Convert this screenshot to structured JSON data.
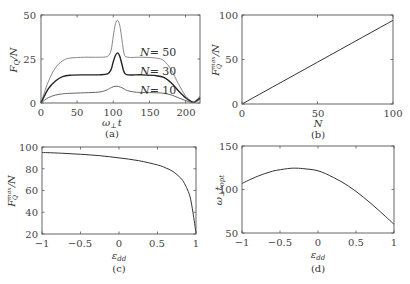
{
  "chart_data": [
    {
      "panel": "(a)",
      "type": "line",
      "title": "",
      "xlabel": "ω⊥t",
      "ylabel": "F_Q/N",
      "xlim": [
        0,
        220
      ],
      "ylim": [
        0,
        50
      ],
      "xticks": [
        0,
        50,
        100,
        150,
        200
      ],
      "yticks": [
        0,
        25,
        50
      ],
      "grid": false,
      "series": [
        {
          "name": "N= 50",
          "color": "#888888",
          "x": [
            0,
            10,
            20,
            30,
            40,
            60,
            80,
            92,
            97,
            100,
            103,
            106,
            109,
            112,
            115,
            120,
            140,
            160,
            170,
            180,
            190,
            200,
            208,
            212,
            216,
            220
          ],
          "y": [
            0,
            12,
            20,
            24,
            25.5,
            26,
            26,
            26.5,
            30,
            38,
            45,
            47,
            44,
            36,
            28,
            26,
            26,
            25.5,
            24,
            19,
            11,
            4,
            1,
            0.5,
            2,
            4
          ]
        },
        {
          "name": "N= 30",
          "color": "#222222",
          "x": [
            0,
            10,
            20,
            30,
            40,
            60,
            80,
            92,
            97,
            100,
            103,
            106,
            109,
            112,
            115,
            120,
            140,
            160,
            170,
            180,
            190,
            200,
            208,
            212,
            216,
            220
          ],
          "y": [
            0,
            8,
            12.5,
            15,
            15.8,
            16,
            16,
            16.5,
            19,
            23.5,
            27,
            28.5,
            26.5,
            22,
            17.5,
            16,
            16,
            15.5,
            14.5,
            11.5,
            7,
            3,
            0.8,
            0.5,
            1.5,
            3
          ]
        },
        {
          "name": "N= 10",
          "color": "#666666",
          "x": [
            0,
            10,
            20,
            30,
            40,
            60,
            80,
            90,
            95,
            100,
            105,
            110,
            115,
            120,
            130,
            140,
            160,
            170,
            180,
            190,
            200,
            208,
            212,
            216,
            220
          ],
          "y": [
            0,
            3,
            4.5,
            5.2,
            5.5,
            5.8,
            6.2,
            7.2,
            8.3,
            9.2,
            9.5,
            9.0,
            8.0,
            7.0,
            6.2,
            6.0,
            5.8,
            5.5,
            4.6,
            3,
            1.4,
            0.4,
            0.3,
            1,
            2
          ]
        }
      ],
      "annotations": [
        "N= 50",
        "N= 30",
        "N= 10"
      ]
    },
    {
      "panel": "(b)",
      "type": "line",
      "title": "",
      "xlabel": "N",
      "ylabel": "F_Q^max/N",
      "xlim": [
        0,
        100
      ],
      "ylim": [
        0,
        100
      ],
      "xticks": [
        0,
        50,
        100
      ],
      "yticks": [
        0,
        50,
        100
      ],
      "grid": false,
      "series": [
        {
          "name": "F_Q^max/N",
          "color": "#333333",
          "x": [
            0,
            100
          ],
          "y": [
            0,
            94
          ]
        }
      ]
    },
    {
      "panel": "(c)",
      "type": "line",
      "title": "",
      "xlabel": "ε_dd",
      "ylabel": "F_Q^max/N",
      "xlim": [
        -1,
        1
      ],
      "ylim": [
        20,
        100
      ],
      "xticks": [
        -1,
        -0.5,
        0,
        0.5,
        1
      ],
      "yticks": [
        20,
        40,
        60,
        80,
        100
      ],
      "grid": false,
      "series": [
        {
          "name": "F_Q^max/N",
          "color": "#333333",
          "x": [
            -1,
            -0.75,
            -0.5,
            -0.25,
            0,
            0.25,
            0.5,
            0.6,
            0.7,
            0.8,
            0.85,
            0.9,
            0.93,
            0.96,
            1.0
          ],
          "y": [
            95,
            94.3,
            93.3,
            92,
            90,
            87.5,
            83.5,
            81,
            77.5,
            71.5,
            66.5,
            59,
            52,
            40,
            21
          ]
        }
      ]
    },
    {
      "panel": "(d)",
      "type": "line",
      "title": "",
      "xlabel": "ε_dd",
      "ylabel": "ω⊥t_opt",
      "xlim": [
        -1,
        1
      ],
      "ylim": [
        50,
        150
      ],
      "xticks": [
        -1,
        -0.5,
        0,
        0.5,
        1
      ],
      "yticks": [
        50,
        100,
        150
      ],
      "grid": false,
      "series": [
        {
          "name": "ω⊥t_opt",
          "color": "#333333",
          "x": [
            -1,
            -0.8,
            -0.6,
            -0.4,
            -0.3,
            -0.2,
            0,
            0.2,
            0.4,
            0.6,
            0.8,
            1.0
          ],
          "y": [
            107,
            115,
            121,
            124,
            124.5,
            124,
            121.5,
            114,
            104,
            91,
            76,
            60
          ]
        }
      ]
    }
  ],
  "panels": {
    "a": {
      "label": "(a)",
      "xlabel_main": "ω",
      "xlabel_sub": "⊥",
      "xlabel_tail": "t",
      "ylabel": "F_Q/N",
      "xticks": [
        "0",
        "50",
        "100",
        "150",
        "200"
      ],
      "yticks": [
        "0",
        "25",
        "50"
      ],
      "legend": [
        "N= 50",
        "N= 30",
        "N= 10"
      ]
    },
    "b": {
      "label": "(b)",
      "xlabel": "N",
      "ylabel": "F_Q^max/N",
      "xticks": [
        "0",
        "50",
        "100"
      ],
      "yticks": [
        "0",
        "50",
        "100"
      ]
    },
    "c": {
      "label": "(c)",
      "xlabel": "ε_dd",
      "ylabel": "F_Q^max/N",
      "xticks": [
        "−1",
        "−0.5",
        "0",
        "0.5",
        "1"
      ],
      "yticks": [
        "20",
        "40",
        "60",
        "80",
        "100"
      ]
    },
    "d": {
      "label": "(d)",
      "xlabel": "ε_dd",
      "ylabel": "ω⊥t_opt",
      "xticks": [
        "−1",
        "−0.5",
        "0",
        "0.5",
        "1"
      ],
      "yticks": [
        "50",
        "100",
        "150"
      ]
    }
  }
}
